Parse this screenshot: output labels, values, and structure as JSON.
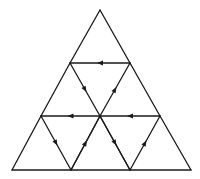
{
  "diagram": {
    "type": "subdivided-triangle-graph",
    "stroke_color": "#1a1a1a",
    "background": "#ffffff",
    "nodes": {
      "apex": [
        100,
        10
      ],
      "l2_left": [
        70,
        63
      ],
      "l2_right": [
        130,
        63
      ],
      "l3_left": [
        41,
        116
      ],
      "l3_center": [
        100,
        116
      ],
      "l3_right": [
        160,
        116
      ],
      "b0": [
        12,
        170
      ],
      "b1": [
        71,
        170
      ],
      "b2": [
        130,
        170
      ],
      "b3": [
        191,
        170
      ]
    },
    "plain_edges": [
      [
        "apex",
        "l2_left"
      ],
      [
        "apex",
        "l2_right"
      ],
      [
        "l2_left",
        "l3_left"
      ],
      [
        "l2_right",
        "l3_right"
      ],
      [
        "l3_left",
        "b0"
      ],
      [
        "l3_right",
        "b3"
      ],
      [
        "b0",
        "b3"
      ],
      [
        "l3_center",
        "b1"
      ],
      [
        "l3_center",
        "b2"
      ]
    ],
    "directed_edges": [
      {
        "from": "l2_right",
        "to": "l2_left",
        "direction": "left"
      },
      {
        "from": "l2_left",
        "to": "l3_center",
        "direction": "down"
      },
      {
        "from": "l3_center",
        "to": "l2_right",
        "direction": "up"
      },
      {
        "from": "l3_center",
        "to": "l3_left",
        "direction": "left"
      },
      {
        "from": "l3_right",
        "to": "l3_center",
        "direction": "left"
      },
      {
        "from": "l3_left",
        "to": "b1",
        "direction": "down"
      },
      {
        "from": "b1",
        "to": "l3_center",
        "direction": "up"
      },
      {
        "from": "l3_center",
        "to": "b2",
        "direction": "down"
      },
      {
        "from": "b2",
        "to": "l3_right",
        "direction": "up"
      }
    ]
  }
}
